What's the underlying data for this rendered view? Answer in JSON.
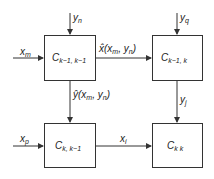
{
  "diagram": {
    "boxes": [
      {
        "id": "c_k-1_k-1",
        "label": "C",
        "sub": "k−1, k−1"
      },
      {
        "id": "c_k-1_k",
        "label": "C",
        "sub": "k−1, k"
      },
      {
        "id": "c_k_k-1",
        "label": "C",
        "sub": "k, k−1"
      },
      {
        "id": "c_k_k",
        "label": "C",
        "sub": "k k"
      }
    ],
    "inputs": {
      "yn": {
        "main": "y",
        "sub": "n"
      },
      "yq": {
        "main": "y",
        "sub": "q"
      },
      "xm": {
        "main": "x",
        "sub": "m"
      },
      "xp": {
        "main": "x",
        "sub": "p"
      }
    },
    "edges": {
      "xhat": {
        "text": "x̂(x",
        "sub1": "m",
        "mid": ", y",
        "sub2": "n",
        "end": ")"
      },
      "yhat": {
        "text": "ŷ(x",
        "sub1": "m",
        "mid": ", y",
        "sub2": "n",
        "end": ")"
      },
      "yj": {
        "main": "y",
        "sub": "j"
      },
      "xi": {
        "main": "x",
        "sub": "i"
      }
    }
  }
}
